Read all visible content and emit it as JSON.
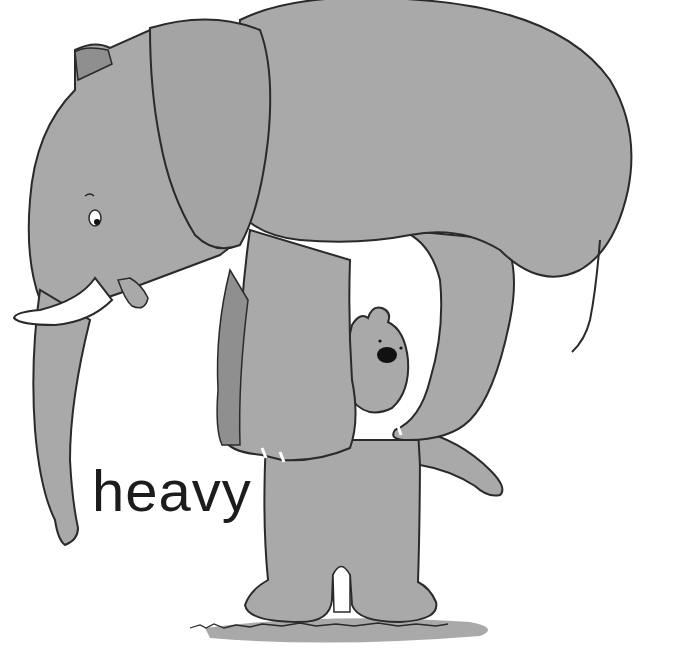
{
  "illustration": {
    "caption": "heavy",
    "subjects": [
      "elephant",
      "bear"
    ],
    "colors": {
      "background": "#ffffff",
      "body_gray": "#a9a9a9",
      "shadow_gray": "#8f8f8f",
      "outline": "#2a2a2a",
      "tusk": "#ffffff",
      "ground_shadow": "#9a9a9a"
    }
  }
}
